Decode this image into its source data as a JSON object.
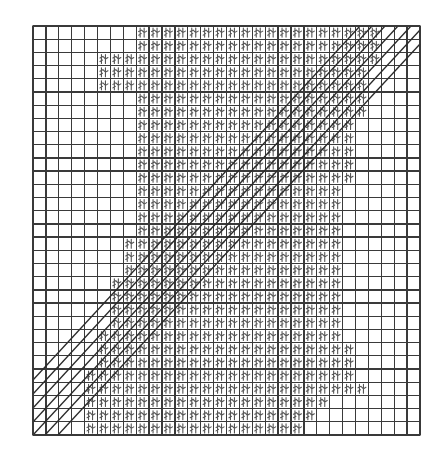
{
  "figure": {
    "colors": {
      "background": "#ffffff",
      "grid": "#3a3a3a",
      "glyph": "#555555",
      "diagonal": "#2a2a2a"
    },
    "grid": {
      "x0": 33,
      "y0": 26,
      "x1": 420,
      "y1": 435,
      "cols": 30,
      "rows": 31
    },
    "glyph_region_rows": [
      [
        8,
        26
      ],
      [
        8,
        26
      ],
      [
        5,
        26
      ],
      [
        5,
        25
      ],
      [
        5,
        25
      ],
      [
        8,
        25
      ],
      [
        8,
        25
      ],
      [
        8,
        24
      ],
      [
        8,
        24
      ],
      [
        8,
        24
      ],
      [
        8,
        24
      ],
      [
        8,
        24
      ],
      [
        8,
        23
      ],
      [
        8,
        23
      ],
      [
        8,
        23
      ],
      [
        8,
        23
      ],
      [
        7,
        23
      ],
      [
        7,
        23
      ],
      [
        7,
        23
      ],
      [
        6,
        23
      ],
      [
        6,
        23
      ],
      [
        6,
        23
      ],
      [
        6,
        23
      ],
      [
        5,
        23
      ],
      [
        5,
        24
      ],
      [
        5,
        24
      ],
      [
        4,
        24
      ],
      [
        4,
        25
      ],
      [
        4,
        22
      ],
      [
        4,
        21
      ],
      [
        4,
        20
      ]
    ],
    "diagonal_band": {
      "lines": [
        {
          "x1": 33,
          "y1": 380,
          "x2": 360,
          "y2": 26
        },
        {
          "x1": 33,
          "y1": 394,
          "x2": 372,
          "y2": 26
        },
        {
          "x1": 33,
          "y1": 408,
          "x2": 385,
          "y2": 26
        },
        {
          "x1": 33,
          "y1": 422,
          "x2": 398,
          "y2": 26
        },
        {
          "x1": 33,
          "y1": 435,
          "x2": 411,
          "y2": 26
        },
        {
          "x1": 45,
          "y1": 435,
          "x2": 420,
          "y2": 30
        },
        {
          "x1": 58,
          "y1": 435,
          "x2": 420,
          "y2": 44
        }
      ]
    }
  }
}
